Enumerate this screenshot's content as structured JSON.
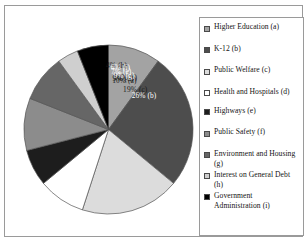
{
  "figure": {
    "clipped_title_fragment": "",
    "background_color": "#ffffff",
    "frame_color": "#9a9a9a"
  },
  "legend": {
    "position": "right",
    "items": [
      {
        "label": "Higher Education (a)",
        "key": "a",
        "color": "#a3a3a3"
      },
      {
        "label": "K-12 (b)",
        "key": "b",
        "color": "#4d4d4d"
      },
      {
        "label": "Public Welfare (c)",
        "key": "c",
        "color": "#dcdcdc"
      },
      {
        "label": "Health and Hospitals (d)",
        "key": "d",
        "color": "#ffffff"
      },
      {
        "label": "Highways (e)",
        "key": "e",
        "color": "#1d1d1d"
      },
      {
        "label": "Public Safety (f)",
        "key": "f",
        "color": "#8c8c8c"
      },
      {
        "label": "Environment and Housing (g)",
        "key": "g",
        "color": "#666666"
      },
      {
        "label": "Interest on General Debt (h)",
        "key": "h",
        "color": "#cfcfcf"
      },
      {
        "label": "Government Administration (i)",
        "key": "i",
        "color": "#000000"
      }
    ]
  },
  "chart_data": {
    "type": "pie",
    "title": "",
    "xlabel": "",
    "ylabel": "",
    "legend_position": "right",
    "grid": false,
    "start_angle_deg": 0,
    "direction": "clockwise",
    "categories": [
      "Higher Education (a)",
      "K-12 (b)",
      "Public Welfare (c)",
      "Health and Hospitals (d)",
      "Highways (e)",
      "Public Safety (f)",
      "Environment and Housing (g)",
      "Interest on General Debt (h)",
      "Government Administration (i)"
    ],
    "keys": [
      "a",
      "b",
      "c",
      "d",
      "e",
      "f",
      "g",
      "h",
      "i"
    ],
    "values": [
      10,
      26,
      19,
      9,
      7,
      10,
      9,
      4,
      6
    ],
    "value_unit": "percent",
    "data_labels": [
      "10% (a)",
      "26% (b)",
      "19% (c)",
      "9% (d)",
      "7% (e)",
      "10% (f)",
      "9% (g)",
      "4% (h)",
      "6% (i)"
    ],
    "colors": [
      "#a3a3a3",
      "#4d4d4d",
      "#dcdcdc",
      "#ffffff",
      "#1d1d1d",
      "#8c8c8c",
      "#666666",
      "#cfcfcf",
      "#000000"
    ],
    "label_text_colors": [
      "#1a1a1a",
      "#ffffff",
      "#1a1a1a",
      "#1a1a1a",
      "#ffffff",
      "#1a1a1a",
      "#ffffff",
      "#1a1a1a",
      "#ffffff"
    ]
  }
}
